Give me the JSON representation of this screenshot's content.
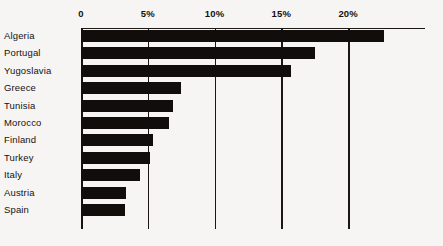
{
  "chart_data": {
    "type": "bar",
    "orientation": "horizontal",
    "title": "",
    "subtitle": "",
    "xlabel": "",
    "ylabel": "",
    "categories": [
      "Algeria",
      "Portugal",
      "Yugoslavia",
      "Greece",
      "Tunisia",
      "Morocco",
      "Finland",
      "Turkey",
      "Italy",
      "Austria",
      "Spain"
    ],
    "values": [
      22.7,
      17.5,
      15.7,
      7.5,
      6.9,
      6.6,
      5.4,
      5.2,
      4.4,
      3.4,
      3.3
    ],
    "series": [
      {
        "name": "",
        "values": [
          22.7,
          17.5,
          15.7,
          7.5,
          6.9,
          6.6,
          5.4,
          5.2,
          4.4,
          3.4,
          3.3
        ]
      }
    ],
    "xlim": [
      0,
      25.7
    ],
    "xticks": [
      0,
      5,
      10,
      15,
      20
    ],
    "xtick_labels": [
      "0",
      "5%",
      "10%",
      "15%",
      "20%"
    ],
    "grid": true,
    "grid_axis": "x",
    "legend": false,
    "legend_position": "none",
    "bar_color": "#100d0b",
    "background_color": "#f6f5f3",
    "axis_color": "#1a1714",
    "annotations": []
  },
  "axis": {
    "ticks": [
      {
        "label": "0",
        "value": 0
      },
      {
        "label": "5%",
        "value": 5
      },
      {
        "label": "10%",
        "value": 10
      },
      {
        "label": "15%",
        "value": 15
      },
      {
        "label": "20%",
        "value": 20
      }
    ]
  },
  "bars": [
    {
      "label": "Algeria",
      "value": 22.7
    },
    {
      "label": "Portugal",
      "value": 17.5
    },
    {
      "label": "Yugoslavia",
      "value": 15.7
    },
    {
      "label": "Greece",
      "value": 7.5
    },
    {
      "label": "Tunisia",
      "value": 6.9
    },
    {
      "label": "Morocco",
      "value": 6.6
    },
    {
      "label": "Finland",
      "value": 5.4
    },
    {
      "label": "Turkey",
      "value": 5.2
    },
    {
      "label": "Italy",
      "value": 4.4
    },
    {
      "label": "Austria",
      "value": 3.4
    },
    {
      "label": "Spain",
      "value": 3.3
    }
  ]
}
